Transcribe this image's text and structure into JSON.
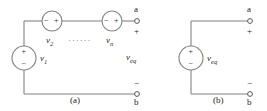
{
  "figure": {
    "panels": [
      {
        "id": "panel-a",
        "caption": "(a)",
        "terminal_top": "a",
        "terminal_bottom": "b",
        "terminal_top_sign": "+",
        "terminal_bottom_sign": "−",
        "port_voltage_label": "v",
        "port_voltage_sub": "eq",
        "ellipsis": "······",
        "sources": [
          {
            "name": "source-v1",
            "label": "v",
            "sub": "1",
            "orientation": "vertical",
            "plus": "+",
            "minus": "−",
            "plus_position": "top",
            "minus_position": "bottom"
          },
          {
            "name": "source-v2",
            "label": "v",
            "sub": "2",
            "orientation": "horizontal",
            "plus": "+",
            "minus": "−",
            "plus_position": "right",
            "minus_position": "left"
          },
          {
            "name": "source-vn",
            "label": "v",
            "sub": "n",
            "orientation": "horizontal",
            "plus": "+",
            "minus": "−",
            "plus_position": "right",
            "minus_position": "left"
          }
        ]
      },
      {
        "id": "panel-b",
        "caption": "(b)",
        "terminal_top": "a",
        "terminal_bottom": "b",
        "terminal_top_sign": "+",
        "terminal_bottom_sign": "−",
        "sources": [
          {
            "name": "source-veq",
            "label": "v",
            "sub": "eq",
            "orientation": "vertical",
            "plus": "+",
            "minus": "−",
            "plus_position": "top",
            "minus_position": "bottom"
          }
        ]
      }
    ],
    "colors": {
      "wire": "#808285",
      "text": "#231f20",
      "background": "#ffffff"
    }
  }
}
